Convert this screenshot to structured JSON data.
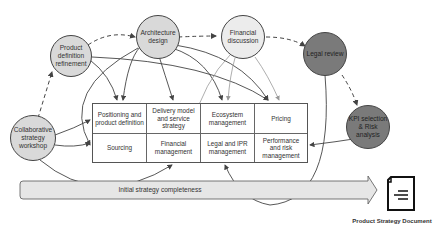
{
  "diagram": {
    "nodes": {
      "collaborative_workshop": "Collaborative strategy workshop",
      "product_definition": "Product definition refinement",
      "architecture_design": "Architecture design",
      "financial_discussion": "Financial discussion",
      "legal_review": "Legal review",
      "kpi_selection": "KPI selection & Risk analysis"
    },
    "grid_cells": [
      "Positioning and product definition",
      "Delivery model and service strategy",
      "Ecosystem management",
      "Pricing",
      "Sourcing",
      "Financial management",
      "Legal and IPR management",
      "Performance and risk management"
    ],
    "progress_arrow": "Initial strategy completeness",
    "output_document": "Product Strategy Document",
    "colors": {
      "light_node": "#d9d9d9",
      "lighter_node": "#ececec",
      "dark_node": "#7a7a7a",
      "arrow_fill": "#e6e6e6"
    }
  }
}
